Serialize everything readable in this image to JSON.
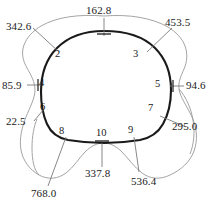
{
  "figure": {
    "type": "annotated-contour-diagram",
    "title": "",
    "background_color": "#ffffff",
    "inner_contour_color": "#1a1a1a",
    "outer_contour_color": "#8a8a8a",
    "leader_line_color": "#7a7a7a",
    "text_color": "#1a1a1a"
  },
  "measurements": [
    {
      "id": "m-162-8",
      "value": "162.8",
      "node": "1",
      "position": "top"
    },
    {
      "id": "m-453-5",
      "value": "453.5",
      "node": "3",
      "position": "top-right"
    },
    {
      "id": "m-342-6",
      "value": "342.6",
      "node": "2",
      "position": "top-left"
    },
    {
      "id": "m-94-6",
      "value": "94.6",
      "node": "5",
      "position": "right"
    },
    {
      "id": "m-85-9",
      "value": "85.9",
      "node": "4",
      "position": "left"
    },
    {
      "id": "m-295-0",
      "value": "295.0",
      "node": "7",
      "position": "bottom-right"
    },
    {
      "id": "m-22-5",
      "value": "22.5",
      "node": "6",
      "position": "bottom-left"
    },
    {
      "id": "m-536-4",
      "value": "536.4",
      "node": "9",
      "position": "bottom-right-lower"
    },
    {
      "id": "m-337-8",
      "value": "337.8",
      "node": "10",
      "position": "bottom"
    },
    {
      "id": "m-768-0",
      "value": "768.0",
      "node": "8",
      "position": "bottom-left-lower"
    }
  ],
  "nodes": [
    {
      "id": "node-2",
      "label": "2"
    },
    {
      "id": "node-3",
      "label": "3"
    },
    {
      "id": "node-4",
      "label": "4"
    },
    {
      "id": "node-5",
      "label": "5"
    },
    {
      "id": "node-6",
      "label": "6"
    },
    {
      "id": "node-7",
      "label": "7"
    },
    {
      "id": "node-8",
      "label": "8"
    },
    {
      "id": "node-9",
      "label": "9"
    },
    {
      "id": "node-10",
      "label": "10"
    }
  ]
}
